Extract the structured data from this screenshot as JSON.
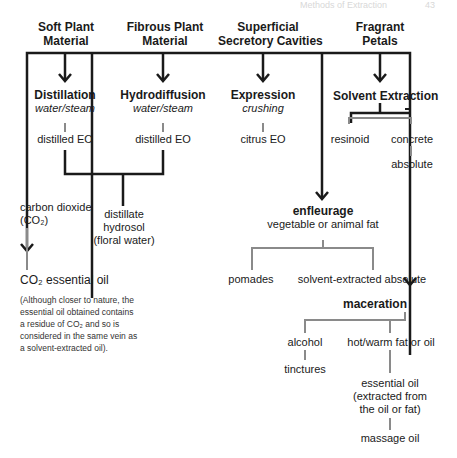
{
  "running_header": {
    "title": "Methods of Extraction",
    "page": "43"
  },
  "sources": [
    {
      "id": "soft",
      "label_line1": "Soft Plant",
      "label_line2": "Material"
    },
    {
      "id": "fibrous",
      "label_line1": "Fibrous Plant",
      "label_line2": "Material"
    },
    {
      "id": "superficial",
      "label_line1": "Superficial",
      "label_line2": "Secretory Cavities"
    },
    {
      "id": "fragrant",
      "label_line1": "Fragrant",
      "label_line2": "Petals"
    }
  ],
  "methods": {
    "distillation": {
      "title": "Distillation",
      "subtitle": "water/steam",
      "product": "distilled EO"
    },
    "hydrodiffusion": {
      "title": "Hydrodiffusion",
      "subtitle": "water/steam",
      "product": "distilled EO"
    },
    "expression": {
      "title": "Expression",
      "subtitle": "crushing",
      "product": "citrus EO"
    },
    "solvent_extraction": {
      "title": "Solvent Extraction",
      "products": [
        "resinoid",
        "concrete"
      ],
      "concrete_product": "absolute"
    },
    "distillate": {
      "line1": "distillate",
      "line2": "hydrosol",
      "line3": "(floral water)"
    },
    "co2": {
      "line1": "carbon dioxide",
      "line2": "(CO₂)",
      "product": "CO₂ essential oil",
      "note": [
        "(Although closer to nature, the",
        "essential oil obtained contains",
        "a residue of CO₂ and so is",
        "considered in the same vein as",
        "a solvent-extracted oil)."
      ]
    },
    "enfleurage": {
      "title": "enfleurage",
      "subtitle": "vegetable or animal fat",
      "products": [
        "pomades",
        "solvent-extracted absolute"
      ]
    },
    "maceration": {
      "title": "maceration",
      "branches": [
        "alcohol",
        "hot/warm fat or oil"
      ],
      "alcohol_product": "tinctures",
      "oil_product": [
        "essential oil",
        "(extracted from",
        "the oil or fat)"
      ],
      "final_product": "massage oil"
    }
  },
  "colors": {
    "primary_line": "#1a1a1a",
    "secondary_line": "#8a8a8a",
    "text": "#1a1a1a"
  }
}
